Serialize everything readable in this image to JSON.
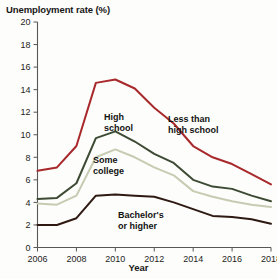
{
  "chart_data": {
    "type": "line",
    "title": "Unemployment rate (%)",
    "xlabel": "Year",
    "ylabel": "",
    "xlim": [
      2006,
      2018
    ],
    "ylim": [
      0,
      20
    ],
    "ytick_step": 2,
    "xtick_step": 2,
    "grid": false,
    "legend": "inline-annotations",
    "yticks": [
      "0",
      "2",
      "4",
      "6",
      "8",
      "10",
      "12",
      "14",
      "16",
      "18",
      "20"
    ],
    "xticks": [
      "2006",
      "2008",
      "2010",
      "2012",
      "2014",
      "2016",
      "2018"
    ],
    "x": [
      2006,
      2007,
      2008,
      2009,
      2010,
      2011,
      2012,
      2013,
      2014,
      2015,
      2016,
      2017,
      2018
    ],
    "series": [
      {
        "name": "Less than high school",
        "label": "Less than\nhigh school",
        "color": "#a8292b",
        "values": [
          6.8,
          7.1,
          9.0,
          14.6,
          14.9,
          14.1,
          12.4,
          11.0,
          9.0,
          8.0,
          7.4,
          6.5,
          5.6
        ]
      },
      {
        "name": "High school",
        "label": "High\nschool",
        "color": "#3d4a34",
        "values": [
          4.3,
          4.4,
          5.7,
          9.7,
          10.3,
          9.4,
          8.3,
          7.5,
          6.0,
          5.4,
          5.2,
          4.6,
          4.1
        ]
      },
      {
        "name": "Some college",
        "label": "Some\ncollege",
        "color": "#c6cbb1",
        "values": [
          3.9,
          3.8,
          4.6,
          8.0,
          8.7,
          8.0,
          7.1,
          6.4,
          5.0,
          4.5,
          4.1,
          3.8,
          3.6
        ]
      },
      {
        "name": "Bachelor's or higher",
        "label": "Bachelor's\nor higher",
        "color": "#2e1a12",
        "values": [
          2.0,
          2.0,
          2.6,
          4.6,
          4.7,
          4.6,
          4.5,
          4.0,
          3.4,
          2.8,
          2.7,
          2.5,
          2.1
        ]
      }
    ]
  }
}
